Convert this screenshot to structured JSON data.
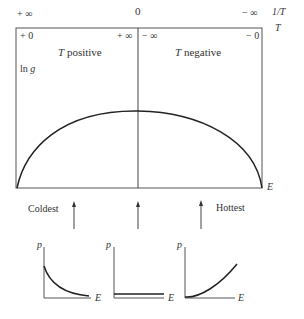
{
  "top_axis": {
    "inverse_T_left": "+ ∞",
    "inverse_T_middle": "0",
    "inverse_T_right": "− ∞",
    "inverse_T_label": "1/T",
    "T_label": "T",
    "T_left": "+ 0",
    "T_mid_left": "+ ∞",
    "T_mid_right": "− ∞",
    "T_right": "− 0"
  },
  "main_plot": {
    "y_label": "ln g",
    "x_label": "E",
    "region_left": "T positive",
    "region_right": "T negative",
    "curve": "concave-down arc, zero at both ends, maximum at middle"
  },
  "annotations": {
    "coldest": "Coldest",
    "hottest": "Hottest"
  },
  "small_plots": [
    {
      "y_label": "p",
      "x_label": "E",
      "shape": "decreasing exponential"
    },
    {
      "y_label": "p",
      "x_label": "E",
      "shape": "flat constant"
    },
    {
      "y_label": "p",
      "x_label": "E",
      "shape": "increasing exponential"
    }
  ]
}
